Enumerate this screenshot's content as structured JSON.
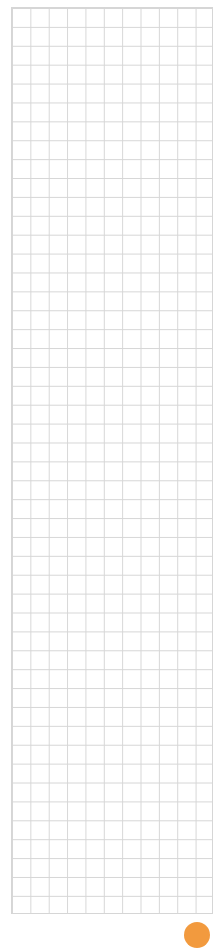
{
  "canvas": {
    "type": "grid",
    "columns": 11,
    "rows": 48,
    "line_color": "#d6d6d6",
    "background": "#ffffff"
  },
  "fab": {
    "color": "#f29a3e",
    "icon": "circle-button"
  }
}
